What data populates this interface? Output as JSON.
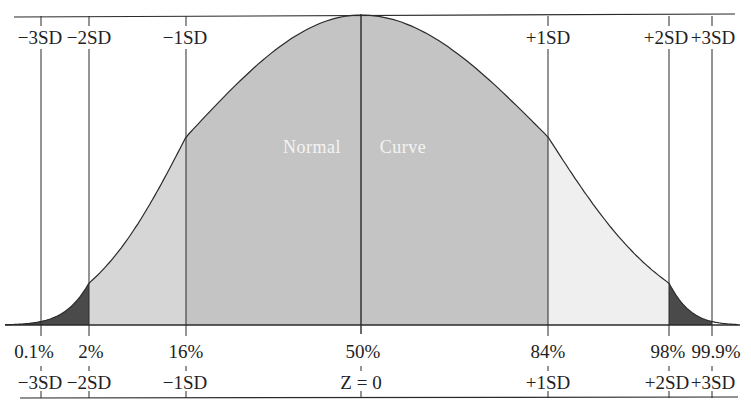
{
  "diagram": {
    "title_left": "Normal",
    "title_right": "Curve",
    "top_labels": [
      "−3SD",
      "−2SD",
      "−1SD",
      "+1SD",
      "+2SD",
      "+3SD"
    ],
    "percent_labels": [
      "0.1%",
      "2%",
      "16%",
      "50%",
      "84%",
      "98%",
      "99.9%"
    ],
    "bottom_labels": [
      "−3SD",
      "−2SD",
      "−1SD",
      "Z = 0",
      "+1SD",
      "+2SD",
      "+3SD"
    ],
    "colors": {
      "tail_dark": "#4a4a4a",
      "band_light": "#d6d6d6",
      "band_center": "#c4c4c4",
      "band_right_light": "#efefef",
      "line": "#2a2a2a",
      "text": "#222222",
      "curve_text": "#f4f4f4"
    }
  },
  "chart_data": {
    "type": "area",
    "xlabel": "Z",
    "ylabel": "",
    "x_ticks_sd": [
      -3,
      -2,
      -1,
      0,
      1,
      2,
      3
    ],
    "sd_labels": [
      "−3SD",
      "−2SD",
      "−1SD",
      "Z = 0",
      "+1SD",
      "+2SD",
      "+3SD"
    ],
    "cumulative_percent": [
      0.1,
      2,
      16,
      50,
      84,
      98,
      99.9
    ],
    "cumulative_percent_labels": [
      "0.1%",
      "2%",
      "16%",
      "50%",
      "84%",
      "98%",
      "99.9%"
    ],
    "shaded_regions": [
      {
        "from": "-inf",
        "to": -2,
        "shade": "dark"
      },
      {
        "from": -2,
        "to": -1,
        "shade": "light"
      },
      {
        "from": -1,
        "to": 1,
        "shade": "medium"
      },
      {
        "from": 1,
        "to": 2,
        "shade": "very light"
      },
      {
        "from": 2,
        "to": 3,
        "shade": "dark"
      }
    ],
    "grid": false,
    "legend": null
  }
}
